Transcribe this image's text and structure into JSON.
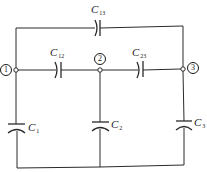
{
  "diagram": {
    "title": "",
    "type": "capacitor network",
    "stroke_color": "#2a2a2a",
    "background_color": "#ffffff",
    "nodes": [
      {
        "id": "1",
        "label": "1",
        "x": 16,
        "y": 70
      },
      {
        "id": "2",
        "label": "2",
        "x": 100,
        "y": 70
      },
      {
        "id": "3",
        "label": "3",
        "x": 183,
        "y": 69
      }
    ],
    "capacitors": [
      {
        "id": "C13",
        "symbol": "C",
        "subscript": "13",
        "between": [
          "1",
          "3"
        ],
        "orientation": "horizontal",
        "position": "top"
      },
      {
        "id": "C12",
        "symbol": "C",
        "subscript": "12",
        "between": [
          "1",
          "2"
        ],
        "orientation": "horizontal",
        "position": "middle-left"
      },
      {
        "id": "C23",
        "symbol": "C",
        "subscript": "23",
        "between": [
          "2",
          "3"
        ],
        "orientation": "horizontal",
        "position": "middle-right"
      },
      {
        "id": "C1",
        "symbol": "C",
        "subscript": "1",
        "between": [
          "1",
          "ground"
        ],
        "orientation": "vertical",
        "position": "left"
      },
      {
        "id": "C2",
        "symbol": "C",
        "subscript": "2",
        "between": [
          "2",
          "ground"
        ],
        "orientation": "vertical",
        "position": "center"
      },
      {
        "id": "C3",
        "symbol": "C",
        "subscript": "3",
        "between": [
          "3",
          "ground"
        ],
        "orientation": "vertical",
        "position": "right"
      }
    ]
  }
}
